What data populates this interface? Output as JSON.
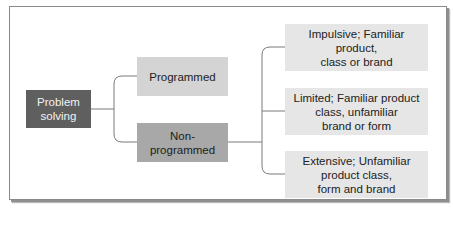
{
  "diagram": {
    "type": "tree",
    "root": {
      "label": "Problem solving",
      "lines": [
        "Problem",
        "solving"
      ],
      "color": "#5f5f5f"
    },
    "branches": [
      {
        "label": "Programmed",
        "color": "#d4d4d4"
      },
      {
        "label": "Non-programmed",
        "color": "#a8a8a8"
      }
    ],
    "leaves": [
      {
        "parent": "Non-programmed",
        "lines": [
          "Impulsive; Familiar product,",
          "class or brand"
        ],
        "color": "#e6e6e6"
      },
      {
        "parent": "Non-programmed",
        "lines": [
          "Limited; Familiar product",
          "class, unfamiliar",
          "brand or form"
        ],
        "color": "#e6e6e6"
      },
      {
        "parent": "Non-programmed",
        "lines": [
          "Extensive; Unfamiliar",
          "product class,",
          "form and brand"
        ],
        "color": "#e6e6e6"
      }
    ],
    "connector_color": "#7a7a7a",
    "frame_border_color": "#8a8a8a"
  }
}
